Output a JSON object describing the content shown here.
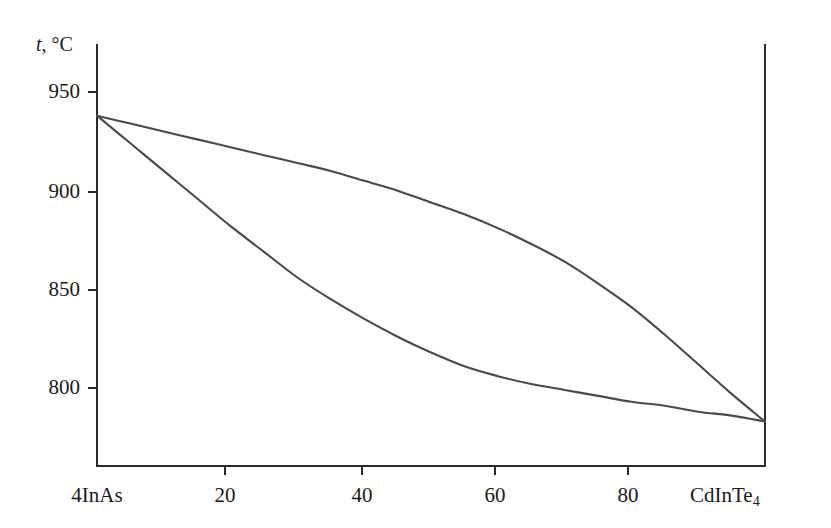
{
  "chart_data": {
    "type": "line",
    "title": "",
    "subtitle": "",
    "xlabel": "",
    "ylabel": "t, °C",
    "ylabel_symbol": "t",
    "ylabel_unit": ", °C",
    "xlim": [
      0,
      100
    ],
    "ylim": [
      770,
      962
    ],
    "grid": false,
    "legend": "none",
    "x_tick_values": [
      0,
      20,
      40,
      60,
      80,
      100
    ],
    "x_tick_labels": [
      "4InAs",
      "20",
      "40",
      "60",
      "80",
      "CdInTe4"
    ],
    "x_endpoint_left_label": "4InAs",
    "x_endpoint_right_label_main": "CdInTe",
    "x_endpoint_right_label_sub": "4",
    "y_tick_values": [
      800,
      850,
      900,
      950
    ],
    "y_tick_labels": [
      "800",
      "850",
      "900",
      "950"
    ],
    "line_color": "#4a4a4a",
    "axis_color": "#2b2b2b",
    "background_color": "#ffffff",
    "series": [
      {
        "name": "liquidus",
        "x": [
          0,
          5,
          10,
          15,
          20,
          25,
          30,
          35,
          40,
          45,
          50,
          55,
          60,
          65,
          70,
          75,
          80,
          85,
          90,
          95,
          100
        ],
        "y": [
          938,
          934,
          930,
          926,
          922,
          918,
          914,
          910,
          905,
          900,
          894,
          888,
          881,
          873,
          864,
          853,
          841,
          827,
          812,
          797,
          783
        ]
      },
      {
        "name": "solidus",
        "x": [
          0,
          5,
          10,
          15,
          20,
          25,
          30,
          35,
          40,
          45,
          50,
          55,
          60,
          65,
          70,
          75,
          80,
          85,
          90,
          95,
          100
        ],
        "y": [
          938,
          924,
          910,
          896,
          882,
          869,
          856,
          845,
          835,
          826,
          818,
          811,
          806,
          802,
          799,
          796,
          793,
          791,
          788,
          786,
          783
        ]
      }
    ]
  },
  "geometry": {
    "x_axis_y_px": 466,
    "y_axis_x_px": 97,
    "right_axis_x_px": 765,
    "top_y_px": 45,
    "x_pixels": [
      97,
      225,
      362,
      495,
      628,
      765
    ],
    "y_pixels_for_ticks": [
      388,
      290,
      192,
      92
    ]
  }
}
